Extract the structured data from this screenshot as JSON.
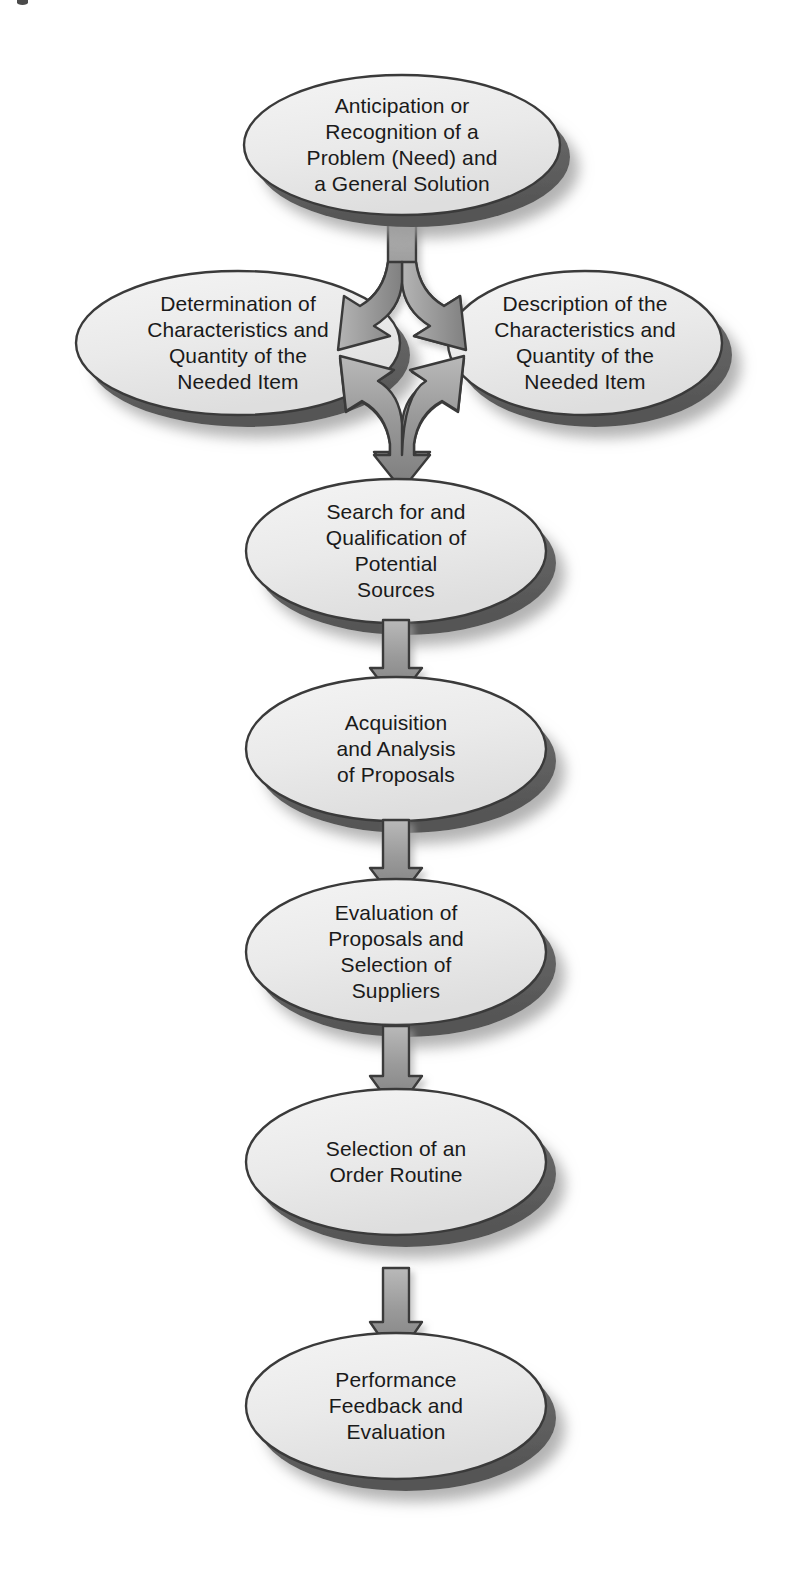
{
  "diagram": {
    "type": "flowchart",
    "orientation": "vertical",
    "canvas": {
      "width": 789,
      "height": 1590
    },
    "colors": {
      "background": "#ffffff",
      "node_fill": "#e9e9e9",
      "node_fill_light": "#f2f2f2",
      "node_outline": "#3a3a3a",
      "node_bevel": "#6e6e6e",
      "node_bevel_dark": "#565656",
      "arrow_fill": "#8f8f8f",
      "arrow_fill_light": "#b5b5b5",
      "arrow_outline": "#3a3a3a",
      "text": "#1a1a1a",
      "shadow": "#bdbdbd"
    },
    "nodes": [
      {
        "id": "anticipation",
        "label": "Anticipation or\nRecognition of a\nProblem (Need) and\na General Solution",
        "cx": 402,
        "cy": 145,
        "rx": 158,
        "ry": 70,
        "step": 1
      },
      {
        "id": "determination",
        "label": "Determination of\nCharacteristics and\nQuantity of the\nNeeded Item",
        "cx": 238,
        "cy": 343,
        "rx": 162,
        "ry": 72,
        "step": 2
      },
      {
        "id": "description",
        "label": "Description of the\nCharacteristics and\nQuantity of the\nNeeded Item",
        "cx": 585,
        "cy": 343,
        "rx": 137,
        "ry": 72,
        "step": 3
      },
      {
        "id": "search",
        "label": "Search for and\nQualification of\nPotential\nSources",
        "cx": 396,
        "cy": 551,
        "rx": 150,
        "ry": 72,
        "step": 4
      },
      {
        "id": "acquisition",
        "label": "Acquisition\nand Analysis\nof Proposals",
        "cx": 396,
        "cy": 749,
        "rx": 150,
        "ry": 72,
        "step": 5
      },
      {
        "id": "evaluation",
        "label": "Evaluation of\nProposals and\nSelection of\nSuppliers",
        "cx": 396,
        "cy": 952,
        "rx": 150,
        "ry": 73,
        "step": 6
      },
      {
        "id": "order-routine",
        "label": "Selection of an\nOrder Routine",
        "cx": 396,
        "cy": 1162,
        "rx": 150,
        "ry": 73,
        "step": 7
      },
      {
        "id": "performance",
        "label": "Performance\nFeedback and\nEvaluation",
        "cx": 396,
        "cy": 1406,
        "rx": 150,
        "ry": 73,
        "step": 8
      }
    ],
    "connectors": [
      {
        "id": "split-to-branches",
        "from": "anticipation",
        "to": [
          "determination",
          "description"
        ],
        "shape": "y-split"
      },
      {
        "id": "merge-to-search",
        "from": [
          "determination",
          "description"
        ],
        "to": "search",
        "shape": "y-merge"
      },
      {
        "id": "search-to-acquisition",
        "from": "search",
        "to": "acquisition",
        "shape": "down-arrow"
      },
      {
        "id": "acquisition-to-evaluation",
        "from": "acquisition",
        "to": "evaluation",
        "shape": "down-arrow"
      },
      {
        "id": "evaluation-to-order",
        "from": "evaluation",
        "to": "order-routine",
        "shape": "down-arrow"
      },
      {
        "id": "order-to-performance",
        "from": "order-routine",
        "to": "performance",
        "shape": "down-arrow"
      }
    ]
  }
}
